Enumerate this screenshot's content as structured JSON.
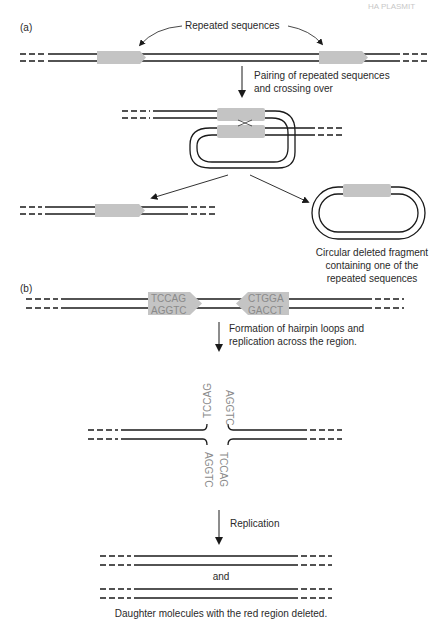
{
  "header": {
    "corner_text": "HA PLASMIT"
  },
  "panel_a": {
    "label": "(a)",
    "repeated_label": "Repeated sequences",
    "step1_line1": "Pairing of repeated sequences",
    "step1_line2": "and crossing over",
    "circle_caption_line1": "Circular deleted fragment",
    "circle_caption_line2": "containing one of the",
    "circle_caption_line3": "repeated sequences"
  },
  "panel_b": {
    "label": "(b)",
    "left_block_top": "TCCAG",
    "left_block_bottom": "AGGTC",
    "right_block_top": "CTGGA",
    "right_block_bottom": "GACCT",
    "step1_line1": "Formation of hairpin loops and",
    "step1_line2": "replication across the region.",
    "hairpin_up_left": "TCCAG",
    "hairpin_up_right": "AGGTC",
    "hairpin_down_left": "AGGTC",
    "hairpin_down_right": "TCCAG",
    "step2": "Replication",
    "and_label": "and",
    "final_caption": "Daughter molecules with the red region deleted."
  },
  "colors": {
    "strand": "#1a1a1a",
    "repeat_block": "#c4c4c4",
    "sequence_text": "#8a8a8a"
  }
}
